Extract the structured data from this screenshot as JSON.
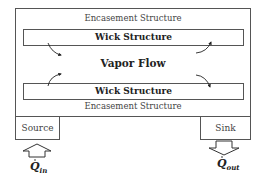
{
  "diagram": {
    "encasement_top_label": "Encasement Structure",
    "encasement_bottom_label": "Encasement Structure",
    "wick_top_label": "Wick Structure",
    "wick_bottom_label": "Wick Structure",
    "center_label": "Vapor Flow",
    "source_label": "Source",
    "sink_label": "Sink",
    "q_in": {
      "symbol": "Q",
      "subscript": "in"
    },
    "q_out": {
      "symbol": "Q",
      "subscript": "out"
    },
    "flow_arrows": [
      {
        "position": "top-left",
        "direction": "down-right"
      },
      {
        "position": "top-right",
        "direction": "up-right"
      },
      {
        "position": "bottom-left",
        "direction": "up-right"
      },
      {
        "position": "bottom-right",
        "direction": "down-right"
      }
    ],
    "heat_arrows": [
      {
        "position": "below-source",
        "direction": "up"
      },
      {
        "position": "below-sink",
        "direction": "down"
      }
    ]
  }
}
